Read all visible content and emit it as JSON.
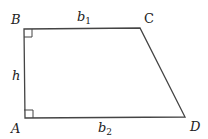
{
  "figure": {
    "shape": "right trapezoid",
    "vertices": [
      {
        "label": "A",
        "x": 25,
        "y": 118
      },
      {
        "label": "B",
        "x": 24,
        "y": 29
      },
      {
        "label": "C",
        "x": 140,
        "y": 28
      },
      {
        "label": "D",
        "x": 185,
        "y": 117
      }
    ],
    "labels": {
      "A": "A",
      "B": "B",
      "C": "C",
      "D": "D",
      "top_base": "b",
      "top_base_sub": "1",
      "bottom_base": "b",
      "bottom_base_sub": "2",
      "height": "h"
    },
    "right_angles": [
      "A",
      "B"
    ],
    "stroke_color": "#444444"
  }
}
